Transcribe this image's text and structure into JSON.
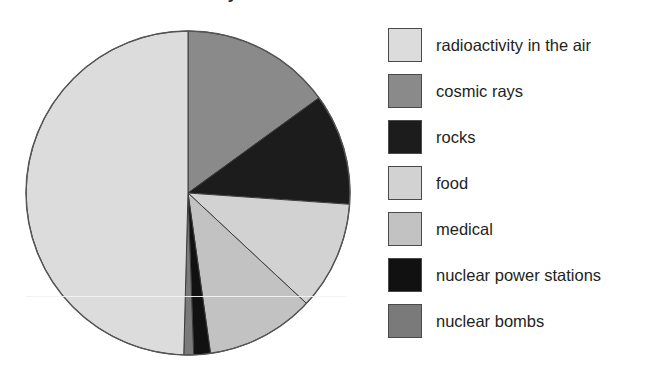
{
  "figure": {
    "title_remnant": "Sources of radioactivity",
    "background": "#ffffff"
  },
  "chart_data": {
    "type": "pie",
    "title": "Sources of radioactivity",
    "xlabel": "",
    "ylabel": "",
    "legend_position": "right",
    "grid": false,
    "start_angle_deg": 0,
    "direction": "clockwise",
    "categories": [
      "radioactivity in the air",
      "cosmic rays",
      "rocks",
      "food",
      "medical",
      "nuclear power stations",
      "nuclear bombs"
    ],
    "values": [
      49.7,
      15.0,
      11.1,
      10.8,
      10.8,
      1.7,
      0.9
    ],
    "units": "percent",
    "colors": [
      "#dcdcdc",
      "#8a8a8a",
      "#1c1c1c",
      "#d2d2d2",
      "#c2c2c2",
      "#111111",
      "#7a7a7a"
    ],
    "slices": [
      {
        "label": "cosmic rays",
        "value": 15.0,
        "color": "#8a8a8a",
        "start_deg": 0,
        "end_deg": 54
      },
      {
        "label": "rocks",
        "value": 11.1,
        "color": "#1c1c1c",
        "start_deg": 54,
        "end_deg": 94
      },
      {
        "label": "food",
        "value": 10.8,
        "color": "#d2d2d2",
        "start_deg": 94,
        "end_deg": 133
      },
      {
        "label": "medical",
        "value": 10.8,
        "color": "#c2c2c2",
        "start_deg": 133,
        "end_deg": 172
      },
      {
        "label": "nuclear power stations",
        "value": 1.7,
        "color": "#111111",
        "start_deg": 172,
        "end_deg": 178
      },
      {
        "label": "nuclear bombs",
        "value": 0.9,
        "color": "#7a7a7a",
        "start_deg": 178,
        "end_deg": 181.5
      },
      {
        "label": "radioactivity in the air",
        "value": 49.7,
        "color": "#dcdcdc",
        "start_deg": 181.5,
        "end_deg": 360
      }
    ],
    "geometry": {
      "cx": 188,
      "cy": 193,
      "r": 162
    }
  },
  "legend": {
    "items": [
      {
        "label": "radioactivity in the air",
        "color": "#dcdcdc",
        "swatch_name": "swatch-radioactivity-in-the-air"
      },
      {
        "label": "cosmic rays",
        "color": "#8a8a8a",
        "swatch_name": "swatch-cosmic-rays"
      },
      {
        "label": "rocks",
        "color": "#1c1c1c",
        "swatch_name": "swatch-rocks"
      },
      {
        "label": "food",
        "color": "#d2d2d2",
        "swatch_name": "swatch-food"
      },
      {
        "label": "medical",
        "color": "#c2c2c2",
        "swatch_name": "swatch-medical"
      },
      {
        "label": "nuclear power stations",
        "color": "#111111",
        "swatch_name": "swatch-nuclear-power-stations"
      },
      {
        "label": "nuclear bombs",
        "color": "#7a7a7a",
        "swatch_name": "swatch-nuclear-bombs"
      }
    ]
  }
}
